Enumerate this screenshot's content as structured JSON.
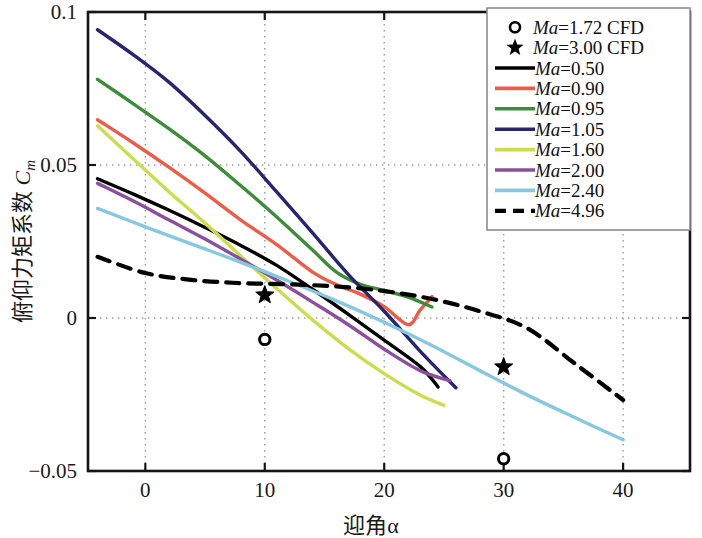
{
  "chart_data": {
    "type": "line",
    "title": "",
    "xlabel": "迎角α",
    "ylabel": "俯仰力矩系数 C_m",
    "ylabel_main": "俯仰力矩系数",
    "ylabel_sym": "C",
    "ylabel_sub": "m",
    "xlim": [
      -4.8,
      45.6
    ],
    "ylim": [
      -0.05,
      0.1
    ],
    "xticks": [
      0,
      10,
      20,
      30,
      40
    ],
    "xticklabels": [
      "0",
      "10",
      "20",
      "30",
      "40"
    ],
    "yticks": [
      -0.05,
      0,
      0.05,
      0.1
    ],
    "yticklabels": [
      "-0.05",
      "0",
      "0.05",
      "0.1"
    ],
    "grid": "dotted",
    "legend_position": "top-right",
    "series": [
      {
        "name": "Ma=1.72 CFD",
        "label_prefix": "Ma",
        "label_value": "=1.72 CFD",
        "kind": "marker",
        "marker": "circle-open",
        "color": "#000000",
        "points": [
          [
            10,
            -0.007
          ],
          [
            30,
            -0.046
          ]
        ]
      },
      {
        "name": "Ma=3.00 CFD",
        "label_prefix": "Ma",
        "label_value": "=3.00 CFD",
        "kind": "marker",
        "marker": "star-filled",
        "color": "#000000",
        "points": [
          [
            10,
            0.0075
          ],
          [
            30,
            -0.016
          ]
        ]
      },
      {
        "name": "Ma=0.50",
        "label_prefix": "Ma",
        "label_value": "=0.50",
        "kind": "line",
        "dash": "none",
        "color": "#000000",
        "x": [
          -4,
          -1,
          2,
          5,
          8,
          11,
          14,
          17,
          20,
          23,
          24.5
        ],
        "y": [
          0.0455,
          0.0405,
          0.0352,
          0.0296,
          0.0237,
          0.0172,
          0.0094,
          0.0012,
          -0.0072,
          -0.0158,
          -0.0225
        ]
      },
      {
        "name": "Ma=0.90",
        "label_prefix": "Ma",
        "label_value": "=0.90",
        "kind": "line",
        "dash": "none",
        "color": "#ee5b47",
        "x": [
          -4,
          -1,
          2,
          5,
          8,
          11,
          14,
          16,
          18,
          20,
          22,
          23,
          24
        ],
        "y": [
          0.0648,
          0.0572,
          0.0492,
          0.0408,
          0.032,
          0.024,
          0.015,
          0.0109,
          0.0078,
          0.0037,
          -0.0022,
          0.0026,
          0.007
        ]
      },
      {
        "name": "Ma=0.95",
        "label_prefix": "Ma",
        "label_value": "=0.95",
        "kind": "line",
        "dash": "none",
        "color": "#3d8c3a",
        "x": [
          -4,
          -1,
          2,
          5,
          8,
          11,
          14,
          16,
          18,
          20,
          22,
          24
        ],
        "y": [
          0.078,
          0.07,
          0.0618,
          0.053,
          0.0432,
          0.033,
          0.0222,
          0.015,
          0.011,
          0.009,
          0.0068,
          0.0036
        ]
      },
      {
        "name": "Ma=1.05",
        "label_prefix": "Ma",
        "label_value": "=1.05",
        "kind": "line",
        "dash": "none",
        "color": "#26256e",
        "x": [
          -4,
          -1,
          2,
          5,
          8,
          11,
          14,
          17,
          20,
          23,
          26
        ],
        "y": [
          0.0942,
          0.086,
          0.077,
          0.0662,
          0.0544,
          0.0412,
          0.0278,
          0.0142,
          0.0022,
          -0.0108,
          -0.0228
        ]
      },
      {
        "name": "Ma=1.60",
        "label_prefix": "Ma",
        "label_value": "=1.60",
        "kind": "line",
        "dash": "none",
        "color": "#cbdd4b",
        "x": [
          -4,
          -1,
          2,
          5,
          8,
          11,
          14,
          17,
          20,
          23,
          25
        ],
        "y": [
          0.0628,
          0.052,
          0.0412,
          0.031,
          0.0202,
          0.0096,
          -0.0006,
          -0.01,
          -0.0182,
          -0.0252,
          -0.0285
        ]
      },
      {
        "name": "Ma=2.00",
        "label_prefix": "Ma",
        "label_value": "=2.00",
        "kind": "line",
        "dash": "none",
        "color": "#8b4f9b",
        "x": [
          -4,
          -1,
          2,
          5,
          8,
          11,
          14,
          17,
          20,
          23,
          25.5
        ],
        "y": [
          0.044,
          0.0382,
          0.032,
          0.0258,
          0.0192,
          0.0124,
          0.0052,
          -0.0022,
          -0.0102,
          -0.0172,
          -0.0205
        ]
      },
      {
        "name": "Ma=2.40",
        "label_prefix": "Ma",
        "label_value": "=2.40",
        "kind": "line",
        "dash": "none",
        "color": "#86c8e0",
        "x": [
          -4,
          0,
          4,
          8,
          12,
          16,
          20,
          24,
          28,
          32,
          36,
          40
        ],
        "y": [
          0.0358,
          0.0298,
          0.024,
          0.0182,
          0.012,
          0.0056,
          -0.0014,
          -0.009,
          -0.0172,
          -0.0252,
          -0.0326,
          -0.0398
        ]
      },
      {
        "name": "Ma=4.96",
        "label_prefix": "Ma",
        "label_value": "=4.96",
        "kind": "line",
        "dash": "dashed",
        "color": "#000000",
        "x": [
          -4,
          0,
          4,
          8,
          12,
          16,
          20,
          24,
          28,
          32,
          36,
          40
        ],
        "y": [
          0.02,
          0.0147,
          0.0124,
          0.0114,
          0.011,
          0.0103,
          0.0088,
          0.0062,
          0.0022,
          -0.0034,
          -0.015,
          -0.0268
        ]
      }
    ]
  },
  "legend": {
    "entries": [
      {
        "marker": "circle-open",
        "label_it": "Ma",
        "label_rest": "=1.72 CFD",
        "color": "#000000"
      },
      {
        "marker": "star-filled",
        "label_it": "Ma",
        "label_rest": "=3.00 CFD",
        "color": "#000000"
      },
      {
        "marker": "line",
        "label_it": "Ma",
        "label_rest": "=0.50",
        "color": "#000000"
      },
      {
        "marker": "line",
        "label_it": "Ma",
        "label_rest": "=0.90",
        "color": "#ee5b47"
      },
      {
        "marker": "line",
        "label_it": "Ma",
        "label_rest": "=0.95",
        "color": "#3d8c3a"
      },
      {
        "marker": "line",
        "label_it": "Ma",
        "label_rest": "=1.05",
        "color": "#26256e"
      },
      {
        "marker": "line",
        "label_it": "Ma",
        "label_rest": "=1.60",
        "color": "#cbdd4b"
      },
      {
        "marker": "line",
        "label_it": "Ma",
        "label_rest": "=2.00",
        "color": "#8b4f9b"
      },
      {
        "marker": "line",
        "label_it": "Ma",
        "label_rest": "=2.40",
        "color": "#86c8e0"
      },
      {
        "marker": "dashed",
        "label_it": "Ma",
        "label_rest": "=4.96",
        "color": "#000000"
      }
    ]
  }
}
